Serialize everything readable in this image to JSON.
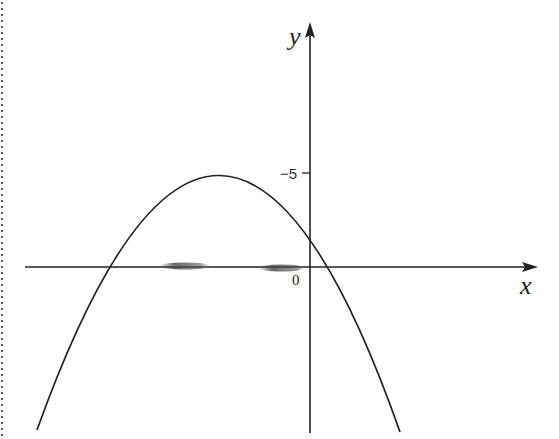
{
  "figure": {
    "axis_labels": {
      "x": "x",
      "y": "y"
    },
    "origin_label": "0",
    "y_tick_label": "−5",
    "curve": "downward-opening parabola",
    "colors": {
      "stroke": "#222222",
      "background": "#ffffff",
      "smudge": "#555555"
    }
  }
}
